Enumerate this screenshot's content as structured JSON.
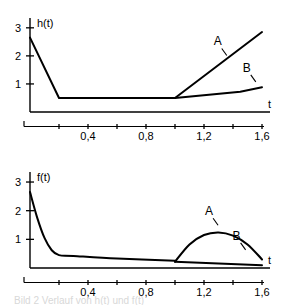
{
  "figure": {
    "caption_fragment": "Bild 2  Verlauf von h(t) und f(t)"
  },
  "chart_data": [
    {
      "type": "line",
      "id": "top",
      "title": "",
      "ylabel": "h(t)",
      "xlabel": "t",
      "xlim": [
        0,
        1.6
      ],
      "ylim": [
        0,
        3.35
      ],
      "grid": false,
      "legend": "inline-labels",
      "xticks": [
        0.0,
        0.2,
        0.4,
        0.6,
        0.8,
        1.0,
        1.2,
        1.4,
        1.6
      ],
      "xticklabels": [
        "",
        "",
        "0,4",
        "",
        "0,8",
        "",
        "1,2",
        "",
        "1,6"
      ],
      "yticks": [
        1,
        2,
        3
      ],
      "yticklabels": [
        "1",
        "2",
        "3"
      ],
      "series": [
        {
          "name": "common",
          "label": "",
          "x": [
            0.0,
            0.2,
            1.0
          ],
          "values": [
            2.65,
            0.5,
            0.5
          ]
        },
        {
          "name": "A",
          "label": "A",
          "x": [
            1.0,
            1.6
          ],
          "values": [
            0.5,
            2.85
          ]
        },
        {
          "name": "B",
          "label": "B",
          "x": [
            1.0,
            1.45,
            1.6
          ],
          "values": [
            0.5,
            0.72,
            0.88
          ]
        }
      ],
      "annotations": [
        {
          "text": "A",
          "x": 1.295,
          "y": 2.37
        },
        {
          "text": "B",
          "x": 1.495,
          "y": 1.43
        }
      ]
    },
    {
      "type": "line",
      "id": "bottom",
      "title": "",
      "ylabel": "f(t)",
      "xlabel": "t",
      "xlim": [
        0,
        1.6
      ],
      "ylim": [
        0,
        3.35
      ],
      "grid": false,
      "legend": "inline-labels",
      "xticks": [
        0.0,
        0.2,
        0.4,
        0.6,
        0.8,
        1.0,
        1.2,
        1.4,
        1.6
      ],
      "xticklabels": [
        "",
        "",
        "0,4",
        "",
        "0,8",
        "",
        "1,2",
        "",
        "1,6"
      ],
      "yticks": [
        1,
        2,
        3
      ],
      "yticklabels": [
        "1",
        "2",
        "3"
      ],
      "series": [
        {
          "name": "common",
          "label": "",
          "x": [
            0.0,
            0.05,
            0.1,
            0.15,
            0.2,
            0.3,
            0.6,
            1.0
          ],
          "values": [
            2.65,
            1.75,
            1.05,
            0.62,
            0.45,
            0.42,
            0.33,
            0.25
          ]
        },
        {
          "name": "A",
          "label": "A",
          "x": [
            1.0,
            1.1,
            1.2,
            1.3,
            1.4,
            1.5,
            1.6
          ],
          "values": [
            0.22,
            0.82,
            1.15,
            1.24,
            1.13,
            0.82,
            0.3
          ]
        },
        {
          "name": "B",
          "label": "B",
          "x": [
            1.0,
            1.3,
            1.6
          ],
          "values": [
            0.22,
            0.16,
            0.1
          ]
        }
      ],
      "annotations": [
        {
          "text": "A",
          "x": 1.235,
          "y": 1.84
        },
        {
          "text": "B",
          "x": 1.425,
          "y": 0.98
        }
      ]
    }
  ]
}
